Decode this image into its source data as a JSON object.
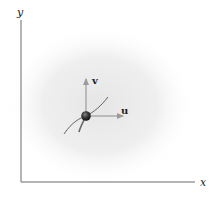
{
  "diagram": {
    "type": "vector-diagram",
    "axes": {
      "x_label": "x",
      "y_label": "y",
      "origin": [
        21,
        182
      ],
      "x_end": [
        195,
        182
      ],
      "y_end": [
        21,
        20
      ],
      "color": "#6b6b6b"
    },
    "particle": {
      "center": [
        86,
        116
      ],
      "radius": 5,
      "color": "#3a3a3a"
    },
    "vectors": [
      {
        "name": "v",
        "label": "v",
        "from": [
          86,
          116
        ],
        "to": [
          86,
          79
        ],
        "color": "#9a9a9a"
      },
      {
        "name": "u",
        "label": "u",
        "from": [
          86,
          116
        ],
        "to": [
          123,
          116
        ],
        "color": "#9a9a9a"
      }
    ],
    "path_curve": {
      "color": "#555555"
    },
    "background_shade": "#ececec"
  }
}
